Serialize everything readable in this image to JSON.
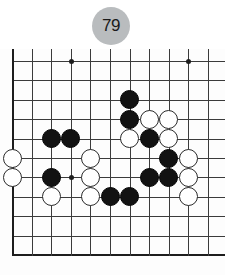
{
  "badge": {
    "move_number": "79"
  },
  "board": {
    "type": "go-board",
    "visible_columns": 11,
    "visible_rows": 11,
    "line_color": "#3b3b3b",
    "edge_color": "#1d1d1d",
    "background": "#fdfdfd",
    "origin_x": 12,
    "origin_y": 12,
    "cell_w": 19.6,
    "cell_h": 19.4,
    "edges": {
      "left": true,
      "bottom": true,
      "top": false,
      "right": false
    },
    "star_points": [
      {
        "col": 3,
        "row": 0
      },
      {
        "col": 9,
        "row": 0
      },
      {
        "col": 3,
        "row": 6
      }
    ],
    "stones": [
      {
        "color": "black",
        "col": 6,
        "row": 2
      },
      {
        "color": "black",
        "col": 6,
        "row": 3
      },
      {
        "color": "white",
        "col": 7,
        "row": 3
      },
      {
        "color": "white",
        "col": 8,
        "row": 3
      },
      {
        "color": "white",
        "col": 6,
        "row": 4
      },
      {
        "color": "black",
        "col": 7,
        "row": 4
      },
      {
        "color": "white",
        "col": 8,
        "row": 4
      },
      {
        "color": "black",
        "col": 2,
        "row": 4
      },
      {
        "color": "black",
        "col": 3,
        "row": 4
      },
      {
        "color": "white",
        "col": 0,
        "row": 5
      },
      {
        "color": "white",
        "col": 4,
        "row": 5
      },
      {
        "color": "black",
        "col": 8,
        "row": 5
      },
      {
        "color": "white",
        "col": 9,
        "row": 5
      },
      {
        "color": "white",
        "col": 0,
        "row": 6
      },
      {
        "color": "black",
        "col": 2,
        "row": 6
      },
      {
        "color": "white",
        "col": 4,
        "row": 6
      },
      {
        "color": "black",
        "col": 7,
        "row": 6
      },
      {
        "color": "black",
        "col": 8,
        "row": 6
      },
      {
        "color": "white",
        "col": 9,
        "row": 6
      },
      {
        "color": "white",
        "col": 2,
        "row": 7
      },
      {
        "color": "white",
        "col": 4,
        "row": 7
      },
      {
        "color": "black",
        "col": 5,
        "row": 7
      },
      {
        "color": "black",
        "col": 6,
        "row": 7
      },
      {
        "color": "white",
        "col": 9,
        "row": 7
      }
    ],
    "stone_colors": {
      "black": "#121212",
      "white": "#ffffff",
      "white_outline": "#2a2a2a"
    }
  }
}
